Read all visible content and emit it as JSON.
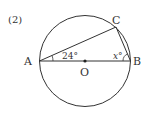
{
  "problem_number": "(2)",
  "points": {
    "A": "A",
    "B": "B",
    "C": "C",
    "O": "O"
  },
  "angles": {
    "CAB": "24°",
    "ABC": "x°"
  },
  "colors": {
    "stroke": "#333333",
    "background": "#ffffff"
  }
}
